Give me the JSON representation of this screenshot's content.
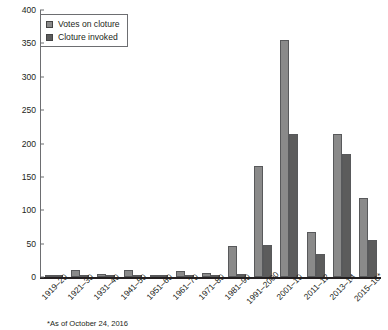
{
  "chart_data": {
    "type": "bar",
    "title": "",
    "xlabel": "",
    "ylabel": "",
    "ylim": [
      0,
      400
    ],
    "ytick_step": 50,
    "yticks": [
      "0",
      "50",
      "100",
      "150",
      "200",
      "250",
      "300",
      "350",
      "400"
    ],
    "grid": false,
    "legend_position": "top-left",
    "categories": [
      "1919–20",
      "1921–30",
      "1931–40",
      "1941–50",
      "1951–60",
      "1961–70",
      "1971–80",
      "1981–90",
      "1991–2000",
      "2001–10",
      "2011–12",
      "2013–14",
      "2015–16*"
    ],
    "series": [
      {
        "name": "Votes on cloture",
        "color": "#8a8a8a",
        "values": [
          3,
          10,
          4,
          10,
          2,
          9,
          6,
          46,
          167,
          355,
          68,
          215,
          118
        ]
      },
      {
        "name": "Cloture invoked",
        "color": "#5c5c5c",
        "values": [
          1,
          0,
          0,
          0,
          0,
          1,
          1,
          4,
          48,
          215,
          35,
          185,
          55
        ]
      }
    ],
    "annotations": [
      "*As of October 24, 2016"
    ]
  },
  "legend": {
    "items": [
      {
        "label": "Votes on cloture",
        "swatch": "legend-swatch-votes"
      },
      {
        "label": "Cloture invoked",
        "swatch": "legend-swatch-invoked"
      }
    ]
  },
  "footnote": {
    "text": "*As of October 24, 2016"
  }
}
